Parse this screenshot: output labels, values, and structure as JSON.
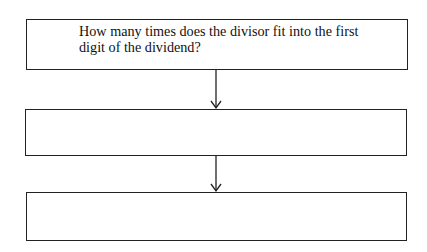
{
  "flowchart": {
    "steps": [
      {
        "text": "How many times does the divisor fit into the first digit of the dividend?"
      },
      {
        "text": ""
      },
      {
        "text": ""
      }
    ],
    "arrows": [
      {
        "from": 0,
        "to": 1
      },
      {
        "from": 1,
        "to": 2
      }
    ],
    "colors": {
      "stroke": "#222222",
      "background": "#ffffff"
    }
  }
}
